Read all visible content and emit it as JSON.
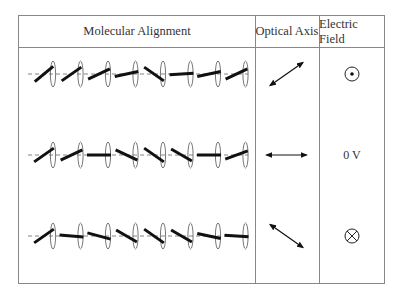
{
  "headers": {
    "molecular_alignment": "Molecular Alignment",
    "optical_axis": "Optical Axis",
    "electric_field": "Electric Field"
  },
  "rows": [
    {
      "name": "positive-field",
      "y": 74,
      "molecule_angles_deg": [
        -40,
        -35,
        -25,
        -12,
        35,
        -4,
        -12,
        -25
      ],
      "optical_axis_angle_deg": -35,
      "electric_field_icon": "dot-in-circle-icon",
      "electric_field_label": ""
    },
    {
      "name": "zero-field",
      "y": 155,
      "molecule_angles_deg": [
        -35,
        -25,
        0,
        25,
        35,
        30,
        0,
        -20
      ],
      "optical_axis_angle_deg": 0,
      "electric_field_icon": "none",
      "electric_field_label": "0 V"
    },
    {
      "name": "negative-field",
      "y": 236,
      "molecule_angles_deg": [
        -35,
        5,
        15,
        30,
        35,
        30,
        12,
        3
      ],
      "optical_axis_angle_deg": 35,
      "electric_field_icon": "cross-in-circle-icon",
      "electric_field_label": ""
    }
  ]
}
